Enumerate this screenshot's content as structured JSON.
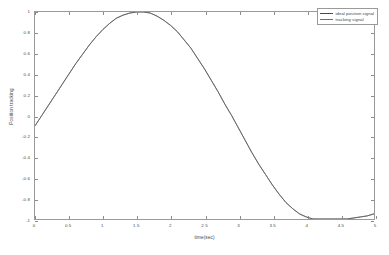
{
  "figure": {
    "background_color": "#ffffff",
    "axes_color": "#9a9a9a"
  },
  "chart_data": {
    "type": "line",
    "title": "",
    "xlabel": "time(sec)",
    "ylabel": "Position tracking",
    "xlim": [
      0,
      5
    ],
    "ylim": [
      -1,
      1
    ],
    "grid": false,
    "legend_position": "top-right",
    "xticks": [
      "0",
      "0.5",
      "1",
      "1.5",
      "2",
      "2.5",
      "3",
      "3.5",
      "4",
      "4.5",
      "5"
    ],
    "xtick_values": [
      0,
      0.5,
      1,
      1.5,
      2,
      2.5,
      3,
      3.5,
      4,
      4.5,
      5
    ],
    "yticks": [
      "1",
      "0.8",
      "0.6",
      "0.4",
      "0.2",
      "0",
      "-0.2",
      "-0.4",
      "-0.6",
      "-0.8",
      "-1"
    ],
    "ytick_values": [
      1,
      0.8,
      0.6,
      0.4,
      0.2,
      0,
      -0.2,
      -0.4,
      -0.6,
      -0.8,
      -1
    ],
    "x": [
      0,
      0.1,
      0.2,
      0.3,
      0.4,
      0.5,
      0.6,
      0.7,
      0.8,
      0.9,
      1.0,
      1.1,
      1.2,
      1.3,
      1.4,
      1.5,
      1.6,
      1.7,
      1.8,
      1.9,
      2.0,
      2.1,
      2.2,
      2.3,
      2.4,
      2.5,
      2.6,
      2.7,
      2.8,
      2.9,
      3.0,
      3.1,
      3.2,
      3.3,
      3.4,
      3.5,
      3.6,
      3.7,
      3.8,
      3.9,
      4.0,
      4.1,
      4.2,
      4.3,
      4.4,
      4.5,
      4.6,
      4.7,
      4.8,
      4.9,
      5.0
    ],
    "series": [
      {
        "name": "ideal position signal",
        "color": "#4a4a4a",
        "values": [
          -0.1,
          0.0,
          0.1,
          0.2,
          0.3,
          0.4,
          0.5,
          0.59,
          0.68,
          0.76,
          0.83,
          0.89,
          0.94,
          0.97,
          0.99,
          1.0,
          1.0,
          0.99,
          0.96,
          0.92,
          0.87,
          0.81,
          0.73,
          0.65,
          0.55,
          0.45,
          0.34,
          0.23,
          0.11,
          0.0,
          -0.12,
          -0.24,
          -0.36,
          -0.47,
          -0.57,
          -0.67,
          -0.76,
          -0.84,
          -0.9,
          -0.95,
          -0.98,
          -1.0,
          -1.0,
          -1.0,
          -1.0,
          -1.0,
          -1.0,
          -0.99,
          -0.98,
          -0.97,
          -0.95
        ]
      },
      {
        "name": "tracking signal",
        "color": "#6e6e6e",
        "values": [
          -0.1,
          0.0,
          0.1,
          0.2,
          0.3,
          0.4,
          0.5,
          0.59,
          0.68,
          0.76,
          0.83,
          0.89,
          0.94,
          0.97,
          0.99,
          1.0,
          1.0,
          0.99,
          0.96,
          0.92,
          0.87,
          0.81,
          0.73,
          0.65,
          0.55,
          0.45,
          0.34,
          0.23,
          0.11,
          0.0,
          -0.12,
          -0.24,
          -0.36,
          -0.47,
          -0.57,
          -0.67,
          -0.76,
          -0.84,
          -0.9,
          -0.95,
          -0.98,
          -1.0,
          -1.0,
          -1.0,
          -1.0,
          -1.0,
          -1.0,
          -0.99,
          -0.98,
          -0.97,
          -0.95
        ]
      }
    ]
  },
  "legend": {
    "entries": [
      {
        "label": "ideal position signal",
        "color": "#4a4a4a"
      },
      {
        "label": "tracking signal",
        "color": "#6e6e6e"
      }
    ]
  }
}
